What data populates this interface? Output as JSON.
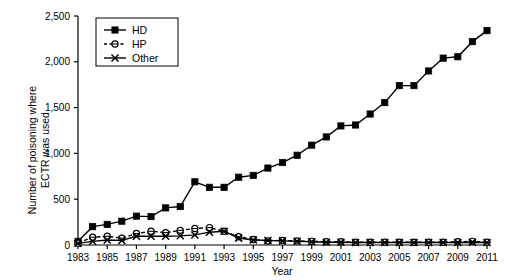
{
  "chart_data": {
    "type": "line",
    "title": "",
    "xlabel": "Year",
    "ylabel": "Number of poisoning where ECTR was used",
    "ylabel_line1": "Number of poisoning where",
    "ylabel_line2": "ECTR was used",
    "xlim": [
      1983,
      2011
    ],
    "ylim": [
      0,
      2500
    ],
    "grid": false,
    "legend_position": "top-left",
    "ytick_labels": [
      "0",
      "500",
      "1,000",
      "1,500",
      "2,000",
      "2,500"
    ],
    "ytick_values": [
      0,
      500,
      1000,
      1500,
      2000,
      2500
    ],
    "xtick_labels": [
      "1983",
      "1985",
      "1987",
      "1989",
      "1991",
      "1993",
      "1995",
      "1997",
      "1999",
      "2001",
      "2003",
      "2005",
      "2007",
      "2009",
      "2011"
    ],
    "xtick_values": [
      1983,
      1985,
      1987,
      1989,
      1991,
      1993,
      1995,
      1997,
      1999,
      2001,
      2003,
      2005,
      2007,
      2009,
      2011
    ],
    "x": [
      1983,
      1984,
      1985,
      1986,
      1987,
      1988,
      1989,
      1990,
      1991,
      1992,
      1993,
      1994,
      1995,
      1996,
      1997,
      1998,
      1999,
      2000,
      2001,
      2002,
      2003,
      2004,
      2005,
      2006,
      2007,
      2008,
      2009,
      2010,
      2011
    ],
    "series": [
      {
        "name": "HD",
        "marker": "filled-square",
        "line": "solid",
        "color": "#000000",
        "values": [
          40,
          200,
          225,
          260,
          315,
          310,
          405,
          420,
          690,
          630,
          630,
          740,
          760,
          840,
          900,
          980,
          1090,
          1180,
          1300,
          1310,
          1430,
          1555,
          1740,
          1740,
          1900,
          2040,
          2055,
          2220,
          2340
        ]
      },
      {
        "name": "HP",
        "marker": "open-circle",
        "line": "dashed",
        "color": "#000000",
        "values": [
          20,
          85,
          95,
          75,
          125,
          150,
          135,
          160,
          180,
          190,
          150,
          90,
          60,
          45,
          50,
          45,
          40,
          35,
          35,
          30,
          30,
          30,
          30,
          30,
          30,
          30,
          35,
          40,
          30
        ]
      },
      {
        "name": "Other",
        "marker": "cross-x",
        "line": "solid",
        "color": "#000000",
        "values": [
          18,
          40,
          55,
          50,
          95,
          95,
          95,
          100,
          110,
          140,
          150,
          75,
          55,
          50,
          45,
          40,
          35,
          30,
          30,
          28,
          28,
          28,
          28,
          28,
          28,
          28,
          28,
          30,
          28
        ]
      }
    ]
  },
  "legend": {
    "entries": [
      {
        "label": "HD"
      },
      {
        "label": "HP"
      },
      {
        "label": "Other"
      }
    ]
  }
}
